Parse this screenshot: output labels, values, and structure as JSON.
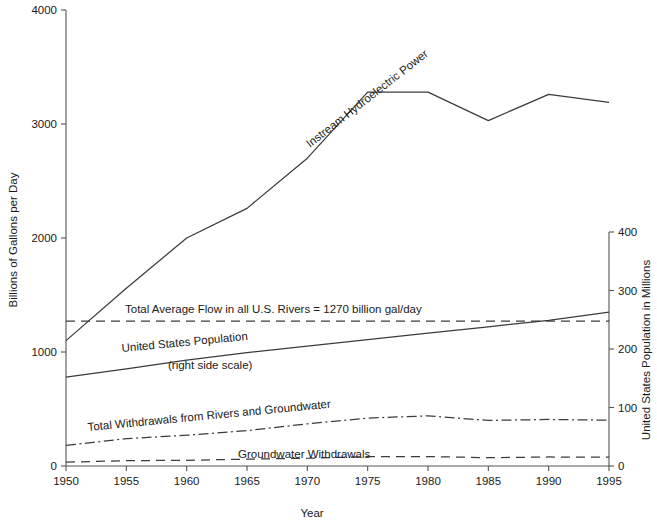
{
  "chart_data": {
    "type": "line",
    "title": "",
    "xlabel": "Year",
    "ylabel": "Billions of Gallons per Day",
    "y2label": "United States Population in Millions",
    "x": [
      1950,
      1955,
      1960,
      1965,
      1970,
      1975,
      1980,
      1985,
      1990,
      1995
    ],
    "xlim": [
      1950,
      1995
    ],
    "xticks": [
      "1950",
      "1955",
      "1960",
      "1965",
      "1970",
      "1975",
      "1980",
      "1985",
      "1990",
      "1995"
    ],
    "ylim": [
      0,
      4000
    ],
    "yticks": [
      "0",
      "1000",
      "2000",
      "3000",
      "4000"
    ],
    "y2lim": [
      0,
      400
    ],
    "y2ticks": [
      "0",
      "100",
      "200",
      "300",
      "400"
    ],
    "grid": false,
    "legend": "in-plot annotations",
    "series": [
      {
        "name": "Instream Hydroelectric Power",
        "axis": "left",
        "style": "solid",
        "values": [
          1100,
          1560,
          2000,
          2260,
          2700,
          3280,
          3280,
          3030,
          3260,
          3190
        ]
      },
      {
        "name": "Total Average Flow in all U.S. Rivers",
        "axis": "left",
        "style": "dashed",
        "values": [
          1270,
          1270,
          1270,
          1270,
          1270,
          1270,
          1270,
          1270,
          1270,
          1270
        ]
      },
      {
        "name": "United States Population",
        "axis": "right",
        "style": "solid",
        "values": [
          152,
          166,
          181,
          194,
          205,
          216,
          227,
          238,
          249,
          263
        ]
      },
      {
        "name": "Total Withdrawals from Rivers and Groundwater",
        "axis": "left",
        "style": "dashdot",
        "values": [
          180,
          240,
          270,
          310,
          370,
          420,
          440,
          400,
          408,
          402
        ]
      },
      {
        "name": "Groundwater Withdrawals",
        "axis": "left",
        "style": "dashed",
        "values": [
          34,
          47,
          50,
          60,
          68,
          82,
          83,
          73,
          79,
          77
        ]
      }
    ],
    "annotations": [
      {
        "id": "hydro-label",
        "text": "Instream Hydroelectric Power",
        "x": 310,
        "y": 148,
        "rotate": -38
      },
      {
        "id": "avgflow-label",
        "text": "Total Average Flow in all U.S. Rivers  =  1270 billion gal/day",
        "x": 125,
        "y": 313,
        "rotate": 0
      },
      {
        "id": "population-label",
        "text": "United States Population",
        "x": 122,
        "y": 352,
        "rotate": -5.5
      },
      {
        "id": "population-sublabel",
        "text": "(right side scale)",
        "x": 168,
        "y": 369,
        "rotate": 0
      },
      {
        "id": "withdrawals-label",
        "text": "Total Withdrawals from Rivers and Groundwater",
        "x": 88,
        "y": 431,
        "rotate": -5.5
      },
      {
        "id": "groundwater-label",
        "text": "Groundwater Withdrawals",
        "x": 238,
        "y": 458,
        "rotate": 0
      }
    ],
    "colors": {
      "line": "#3b3b3b",
      "axis": "#555555",
      "text": "#1a1a1a",
      "background": "#ffffff"
    }
  },
  "plot_geometry": {
    "left": 66,
    "right": 609,
    "top": 10,
    "bottom": 466
  }
}
